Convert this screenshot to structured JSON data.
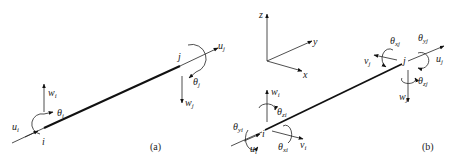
{
  "figure_a": {
    "caption": "(a)",
    "labels": {
      "node_i": "i",
      "node_j": "j",
      "u_i": "u",
      "u_i_sub": "i",
      "w_i": "w",
      "w_i_sub": "i",
      "theta_i": "θ",
      "theta_i_sub": "i",
      "u_j": "u",
      "u_j_sub": "j",
      "w_j": "w",
      "w_j_sub": "j",
      "theta_j": "θ",
      "theta_j_sub": "j"
    }
  },
  "figure_b": {
    "caption": "(b)",
    "axes": {
      "z": "z",
      "y": "y",
      "x": "x"
    },
    "labels": {
      "node_i": "i",
      "node_j": "j",
      "u_i": "u",
      "u_i_sub": "i",
      "v_i": "v",
      "v_i_sub": "i",
      "w_i": "w",
      "w_i_sub": "i",
      "theta_xi": "θ",
      "theta_xi_sub": "xi",
      "theta_yi": "θ",
      "theta_yi_sub": "yi",
      "theta_zi": "θ",
      "theta_zi_sub": "zi",
      "u_j": "u",
      "u_j_sub": "j",
      "v_j": "v",
      "v_j_sub": "j",
      "w_j": "w",
      "w_j_sub": "j",
      "theta_xj": "θ",
      "theta_xj_sub": "xj",
      "theta_yj": "θ",
      "theta_yj_sub": "yj",
      "theta_zj": "θ",
      "theta_zj_sub": "zj"
    }
  }
}
